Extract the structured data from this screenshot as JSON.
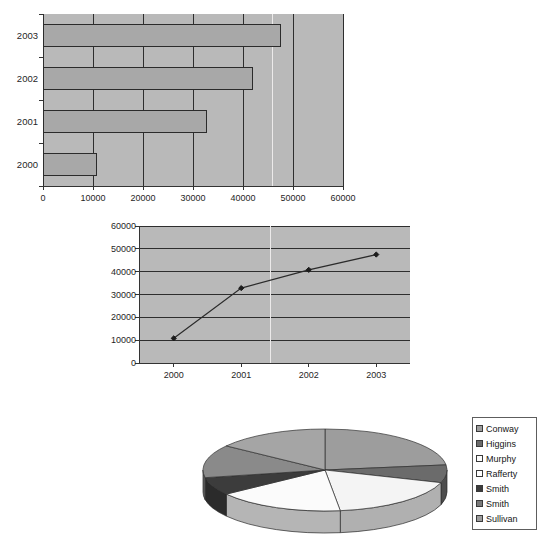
{
  "chart_data": [
    {
      "type": "bar",
      "orientation": "horizontal",
      "title": "",
      "xlabel": "",
      "ylabel": "",
      "categories": [
        "2003",
        "2002",
        "2001",
        "2000"
      ],
      "values": [
        47500,
        42000,
        32800,
        10800
      ],
      "xlim": [
        0,
        60000
      ],
      "xticks": [
        "0",
        "10000",
        "20000",
        "30000",
        "40000",
        "50000",
        "60000"
      ],
      "xtick_values": [
        0,
        10000,
        20000,
        30000,
        40000,
        50000,
        60000
      ],
      "grid": true,
      "legend": "none",
      "plot_bg": "#b9b9b9",
      "bar_fill": "#a8a8a8",
      "bar_border": "#2b2b2b"
    },
    {
      "type": "line",
      "title": "",
      "xlabel": "",
      "ylabel": "",
      "categories": [
        "2000",
        "2001",
        "2002",
        "2003"
      ],
      "values": [
        10800,
        32800,
        40800,
        47500
      ],
      "ylim": [
        0,
        60000
      ],
      "yticks": [
        "0",
        "10000",
        "20000",
        "30000",
        "40000",
        "50000",
        "60000"
      ],
      "ytick_values": [
        0,
        10000,
        20000,
        30000,
        40000,
        50000,
        60000
      ],
      "grid": true,
      "marker": "diamond",
      "legend": "none",
      "plot_bg": "#b9b9b9",
      "line_color": "#2b2b2b"
    },
    {
      "type": "pie",
      "style": "3d",
      "title": "",
      "labels": [
        "Conway",
        "Higgins",
        "Murphy",
        "Rafferty",
        "Smith",
        "Smith",
        "Sullivan"
      ],
      "values": [
        23,
        7,
        18,
        17,
        7,
        13,
        15
      ],
      "colors": [
        "#9d9d9d",
        "#6b6b6b",
        "#f4f4f4",
        "#fbfbfb",
        "#3c3c3c",
        "#8a8a8a",
        "#a5a5a5"
      ],
      "legend": "right"
    }
  ],
  "legend": {
    "items": [
      {
        "label": "Conway",
        "color": "#9d9d9d"
      },
      {
        "label": "Higgins",
        "color": "#6b6b6b"
      },
      {
        "label": "Murphy",
        "color": "#fbfbfb"
      },
      {
        "label": "Rafferty",
        "color": "#ffffff"
      },
      {
        "label": "Smith",
        "color": "#3c3c3c"
      },
      {
        "label": "Smith",
        "color": "#7a7a7a"
      },
      {
        "label": "Sullivan",
        "color": "#9d9d9d"
      }
    ]
  }
}
